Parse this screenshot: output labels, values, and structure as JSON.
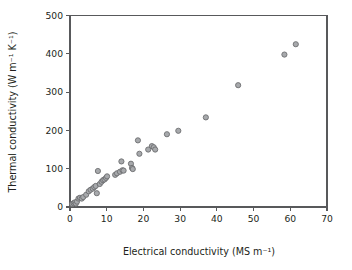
{
  "chart_data": {
    "type": "scatter",
    "title": "",
    "xlabel": "Electrical conductivity (MS m⁻¹)",
    "ylabel": "Thermal conductivity (W m⁻¹ K⁻¹)",
    "xlim": [
      0,
      70
    ],
    "ylim": [
      0,
      500
    ],
    "xticks": [
      0,
      10,
      20,
      30,
      40,
      50,
      60,
      70
    ],
    "yticks": [
      0,
      100,
      200,
      300,
      400,
      500
    ],
    "xtick_labels": [
      "0",
      "10",
      "20",
      "30",
      "40",
      "50",
      "60",
      "70"
    ],
    "ytick_labels": [
      "0",
      "100",
      "200",
      "300",
      "400",
      "500"
    ],
    "grid": false,
    "legend": null,
    "marker": {
      "shape": "circle",
      "fill_color": "#a7a9ac",
      "edge_color": "#6d6e71",
      "size_px": 5.2
    },
    "series": [
      {
        "name": "materials",
        "points": [
          [
            0.6,
            8
          ],
          [
            1.0,
            10
          ],
          [
            1.3,
            12
          ],
          [
            1.6,
            9
          ],
          [
            1.9,
            14
          ],
          [
            2.3,
            22
          ],
          [
            2.7,
            24
          ],
          [
            3.2,
            22
          ],
          [
            3.6,
            26
          ],
          [
            4.4,
            32
          ],
          [
            5.1,
            41
          ],
          [
            5.6,
            45
          ],
          [
            6.2,
            48
          ],
          [
            6.6,
            52
          ],
          [
            7.0,
            55
          ],
          [
            7.3,
            36
          ],
          [
            7.6,
            94
          ],
          [
            8.1,
            60
          ],
          [
            8.6,
            66
          ],
          [
            9.0,
            70
          ],
          [
            9.4,
            72
          ],
          [
            9.8,
            76
          ],
          [
            10.1,
            80
          ],
          [
            12.3,
            84
          ],
          [
            12.8,
            88
          ],
          [
            13.6,
            92
          ],
          [
            14.0,
            119
          ],
          [
            14.3,
            96
          ],
          [
            14.6,
            95
          ],
          [
            16.6,
            113
          ],
          [
            16.9,
            102
          ],
          [
            17.1,
            99
          ],
          [
            18.5,
            174
          ],
          [
            18.9,
            139
          ],
          [
            21.3,
            150
          ],
          [
            22.3,
            159
          ],
          [
            22.8,
            156
          ],
          [
            23.2,
            150
          ],
          [
            26.4,
            190
          ],
          [
            29.5,
            199
          ],
          [
            37.0,
            234
          ],
          [
            45.8,
            318
          ],
          [
            58.4,
            398
          ],
          [
            61.5,
            425
          ]
        ]
      }
    ]
  }
}
